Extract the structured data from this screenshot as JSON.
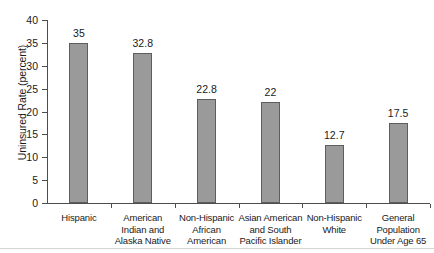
{
  "chart_data": {
    "type": "bar",
    "title": "",
    "xlabel": "",
    "ylabel": "Uninsured Rate (percent)",
    "ylim": [
      0,
      40
    ],
    "ytick_step": 5,
    "grid": false,
    "legend": false,
    "bar_color": "#9a9a9a",
    "bar_edge_color": "#5e5e5e",
    "axis_color": "#4d4d4d",
    "background": "#ffffff",
    "categories": [
      "Hispanic",
      "American Indian and Alaska Native",
      "Non-Hispanic African American",
      "Asian American and South Pacific Islander",
      "Non-Hispanic White",
      "General Population Under Age 65"
    ],
    "category_lines": [
      [
        "Hispanic"
      ],
      [
        "American",
        "Indian and",
        "Alaska Native"
      ],
      [
        "Non-Hispanic",
        "African",
        "American"
      ],
      [
        "Asian American",
        "and South",
        "Pacific Islander"
      ],
      [
        "Non-Hispanic",
        "White"
      ],
      [
        "General",
        "Population",
        "Under Age 65"
      ]
    ],
    "values": [
      35,
      32.8,
      22.8,
      22,
      12.7,
      17.5
    ],
    "value_labels": [
      "35",
      "32.8",
      "22.8",
      "22",
      "12.7",
      "17.5"
    ],
    "ytick_labels": [
      "0",
      "5",
      "10",
      "15",
      "20",
      "25",
      "30",
      "35",
      "40"
    ],
    "yticks": [
      0,
      5,
      10,
      15,
      20,
      25,
      30,
      35,
      40
    ]
  }
}
